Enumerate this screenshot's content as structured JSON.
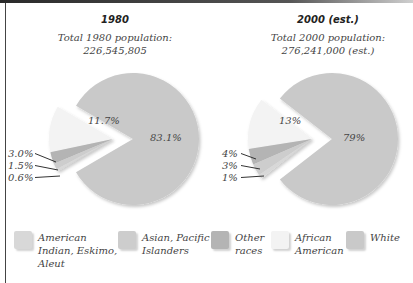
{
  "colors": {
    "white": "#c9c9c9",
    "african_american": "#f3f3f3",
    "other_races": "#b4b4b4",
    "asian_pacific": "#cdcdcd",
    "american_indian": "#d8d8d8",
    "leader_line": "#333333"
  },
  "charts": [
    {
      "title": "1980",
      "subtitle_line1": "Total 1980 population:",
      "subtitle_line2": "226,545,805"
    },
    {
      "title": "2000 (est.)",
      "subtitle_line1": "Total 2000 population:",
      "subtitle_line2": "276,241,000 (est.)"
    }
  ],
  "legend": [
    {
      "key": "american_indian",
      "label": "American\nIndian, Eskimo,\nAleut"
    },
    {
      "key": "asian_pacific",
      "label": "Asian, Pacific\nIslanders"
    },
    {
      "key": "other_races",
      "label": "Other\nraces"
    },
    {
      "key": "african_american",
      "label": "African\nAmerican"
    },
    {
      "key": "white",
      "label": "White"
    }
  ],
  "chart_data": [
    {
      "type": "pie",
      "title": "1980",
      "subtitle": "Total 1980 population: 226,545,805",
      "categories": [
        "White",
        "African American",
        "Other races",
        "Asian, Pacific Islanders",
        "American Indian, Eskimo, Aleut"
      ],
      "values": [
        83.1,
        11.7,
        3.0,
        1.5,
        0.6
      ],
      "labels": [
        "83.1%",
        "11.7%",
        "3.0%",
        "1.5%",
        "0.6%"
      ],
      "exploded": [
        "African American",
        "Other races",
        "Asian, Pacific Islanders",
        "American Indian, Eskimo, Aleut"
      ],
      "legend_position": "bottom"
    },
    {
      "type": "pie",
      "title": "2000 (est.)",
      "subtitle": "Total 2000 population: 276,241,000 (est.)",
      "categories": [
        "White",
        "African American",
        "Other races",
        "Asian, Pacific Islanders",
        "American Indian, Eskimo, Aleut"
      ],
      "values": [
        79,
        13,
        4,
        3,
        1
      ],
      "labels": [
        "79%",
        "13%",
        "4%",
        "3%",
        "1%"
      ],
      "exploded": [
        "African American",
        "Other races",
        "Asian, Pacific Islanders",
        "American Indian, Eskimo, Aleut"
      ],
      "legend_position": "bottom"
    }
  ]
}
